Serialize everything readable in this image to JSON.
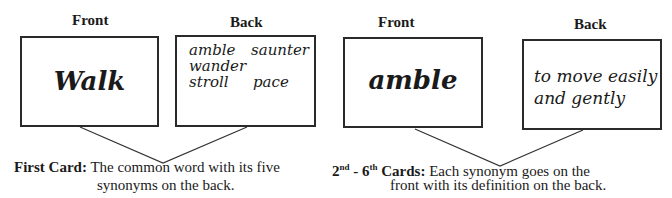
{
  "panels": [
    {
      "front_header": "Front",
      "back_header": "Back",
      "front_word": "Walk",
      "back_words": [
        "amble",
        "saunter",
        "wander",
        "stroll",
        "pace"
      ],
      "caption_bold": "First Card:",
      "caption_line1": "The common word with its five",
      "caption_line2": "synonyms on the back."
    },
    {
      "front_header": "Front",
      "back_header": "Back",
      "front_word": "amble",
      "back_line1": "to move easily",
      "back_line2": "and gently",
      "caption_num1": "2",
      "caption_sup1": "nd",
      "caption_dash": " - ",
      "caption_num2": "6",
      "caption_sup2": "th",
      "caption_bold": "Cards:",
      "caption_line1": "Each synonym goes on the",
      "caption_line2": "front with its definition on the back."
    }
  ],
  "colors": {
    "border": "#2a2a2a",
    "text": "#1a1a1a",
    "background": "#ffffff"
  }
}
